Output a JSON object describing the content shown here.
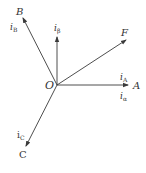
{
  "diagram": {
    "type": "phasor-vector-diagram",
    "origin": {
      "label": "O",
      "x": 57,
      "y": 85
    },
    "colors": {
      "line": "#3a3a3a",
      "text": "#333333",
      "background": "#ffffff"
    },
    "vectors": [
      {
        "id": "A",
        "axis_label": "A",
        "current_labels": [
          "iA",
          "iα"
        ],
        "tip": [
          128,
          85
        ]
      },
      {
        "id": "B",
        "axis_label": "B",
        "current_labels": [
          "iB"
        ],
        "tip": [
          23,
          18
        ]
      },
      {
        "id": "C",
        "axis_label": "C",
        "current_labels": [
          "iC"
        ],
        "tip": [
          26,
          145
        ]
      },
      {
        "id": "beta",
        "axis_label": "",
        "current_labels": [
          "iβ"
        ],
        "tip": [
          57,
          37
        ]
      },
      {
        "id": "F",
        "axis_label": "F",
        "current_labels": [],
        "tip": [
          126,
          40
        ]
      }
    ]
  },
  "labels": {
    "origin": "O",
    "A": "A",
    "B": "B",
    "C": "C",
    "F": "F",
    "iA_i": "i",
    "iA_sub": "A",
    "ialpha_i": "i",
    "ialpha_sub": "α",
    "iB_i": "i",
    "iB_sub": "B",
    "ibeta_i": "i",
    "ibeta_sub": "β",
    "iC_i": "i",
    "iC_sub": "C"
  }
}
